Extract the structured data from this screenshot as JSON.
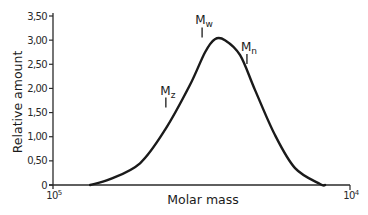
{
  "chart_data": {
    "type": "line",
    "title": "",
    "xlabel": "Molar mass",
    "ylabel": "Relative amount",
    "x_scale": "log (reversed)",
    "xlim_labels": {
      "left": "10",
      "left_exp": "5",
      "right": "10",
      "right_exp": "4"
    },
    "ylim": [
      0,
      3.5
    ],
    "y_ticks": [
      {
        "value": 0,
        "label": "0"
      },
      {
        "value": 0.5,
        "label": "0,50"
      },
      {
        "value": 1.0,
        "label": "1,00"
      },
      {
        "value": 1.5,
        "label": "1,50"
      },
      {
        "value": 2.0,
        "label": "2,00"
      },
      {
        "value": 2.5,
        "label": "2,50"
      },
      {
        "value": 3.0,
        "label": "3,00"
      },
      {
        "value": 3.5,
        "label": "3,50"
      }
    ],
    "grid": false,
    "legend": null,
    "series": [
      {
        "name": "Molar mass distribution",
        "x_fraction": [
          0.125,
          0.192,
          0.293,
          0.377,
          0.461,
          0.512,
          0.545,
          0.579,
          0.63,
          0.68,
          0.747,
          0.815,
          0.899,
          0.916
        ],
        "values": [
          0.0,
          0.12,
          0.45,
          1.14,
          2.07,
          2.75,
          3.02,
          3.0,
          2.69,
          1.97,
          1.04,
          0.35,
          0.02,
          0.0
        ]
      }
    ],
    "annotations": [
      {
        "label": "M",
        "sub": "z",
        "x_fraction": 0.38,
        "y_value": 1.75
      },
      {
        "label": "M",
        "sub": "w",
        "x_fraction": 0.502,
        "y_value": 3.2
      },
      {
        "label": "M",
        "sub": "n",
        "x_fraction": 0.653,
        "y_value": 2.65
      }
    ]
  },
  "colors": {
    "line": "#1a1a1a",
    "axis": "#2a2a2a",
    "background": "#ffffff"
  }
}
